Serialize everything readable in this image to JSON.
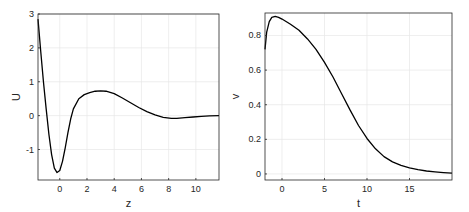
{
  "chart_data": [
    {
      "type": "line",
      "title": "",
      "xlabel": "z",
      "ylabel": "U",
      "xlim": [
        -1.6,
        11.7
      ],
      "ylim": [
        -1.9,
        3
      ],
      "xticks": [
        0,
        2,
        4,
        6,
        8,
        10
      ],
      "yticks": [
        -1,
        0,
        1,
        2,
        3
      ],
      "grid": true,
      "series": [
        {
          "name": "U(z)",
          "color": "#000000",
          "x": [
            -1.6,
            -1.4,
            -1.2,
            -1.0,
            -0.8,
            -0.6,
            -0.4,
            -0.2,
            0.0,
            0.2,
            0.4,
            0.6,
            0.8,
            1.0,
            1.4,
            1.8,
            2.2,
            2.6,
            3.0,
            3.4,
            4.0,
            4.6,
            5.2,
            5.8,
            6.4,
            7.0,
            7.6,
            8.2,
            8.6,
            9.2,
            9.8,
            10.4,
            11.0,
            11.7
          ],
          "y": [
            2.85,
            1.9,
            1.0,
            0.2,
            -0.55,
            -1.15,
            -1.55,
            -1.68,
            -1.62,
            -1.35,
            -0.95,
            -0.5,
            -0.1,
            0.2,
            0.5,
            0.62,
            0.68,
            0.72,
            0.73,
            0.72,
            0.65,
            0.52,
            0.38,
            0.24,
            0.12,
            0.02,
            -0.05,
            -0.08,
            -0.08,
            -0.06,
            -0.04,
            -0.02,
            -0.01,
            0.0
          ]
        }
      ]
    },
    {
      "type": "line",
      "title": "",
      "xlabel": "t",
      "ylabel": "v",
      "xlim": [
        -2,
        20
      ],
      "ylim": [
        -0.035,
        0.93
      ],
      "xticks": [
        0,
        5,
        10,
        15
      ],
      "yticks": [
        0,
        0.2,
        0.4,
        0.6,
        0.8
      ],
      "grid": true,
      "series": [
        {
          "name": "v(t)",
          "color": "#000000",
          "x": [
            -2,
            -1.8,
            -1.5,
            -1.2,
            -0.8,
            -0.4,
            0,
            1,
            2,
            3,
            4,
            5,
            6,
            7,
            8,
            9,
            10,
            11,
            12,
            13,
            14,
            15,
            16,
            17,
            18,
            19,
            20
          ],
          "y": [
            0.72,
            0.82,
            0.88,
            0.905,
            0.91,
            0.905,
            0.895,
            0.865,
            0.83,
            0.78,
            0.72,
            0.645,
            0.56,
            0.465,
            0.37,
            0.28,
            0.205,
            0.145,
            0.1,
            0.07,
            0.05,
            0.035,
            0.025,
            0.017,
            0.012,
            0.008,
            0.005
          ]
        }
      ]
    }
  ]
}
